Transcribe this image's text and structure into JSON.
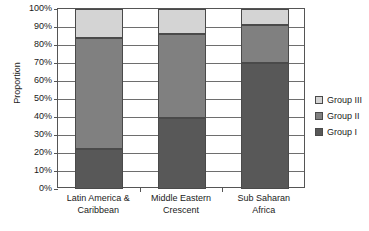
{
  "chart_data": {
    "type": "bar",
    "stacked": true,
    "stack_mode": "percent",
    "title": "",
    "xlabel": "",
    "ylabel": "Proportion",
    "ylim": [
      0,
      100
    ],
    "y_tick_labels": [
      "100%",
      "90%",
      "80%",
      "70%",
      "60%",
      "50%",
      "40%",
      "30%",
      "20%",
      "10%",
      "0%"
    ],
    "y_ticks": [
      100,
      90,
      80,
      70,
      60,
      50,
      40,
      30,
      20,
      10,
      0
    ],
    "grid": true,
    "legend_position": "right",
    "categories": [
      "Latin America & Caribbean",
      "Middle Eastern Crescent",
      "Sub Saharan Africa"
    ],
    "category_lines": [
      [
        "Latin America &",
        "Caribbean"
      ],
      [
        "Middle Eastern",
        "Crescent"
      ],
      [
        "Sub Saharan",
        "Africa"
      ]
    ],
    "series": [
      {
        "name": "Group I",
        "color": "#585858",
        "values": [
          22,
          39.5,
          70
        ]
      },
      {
        "name": "Group II",
        "color": "#808080",
        "values": [
          62,
          46.5,
          21
        ]
      },
      {
        "name": "Group III",
        "color": "#d4d4d4",
        "values": [
          16,
          14,
          9
        ]
      }
    ],
    "legend_order": [
      "Group III",
      "Group II",
      "Group I"
    ],
    "cumulative_tops": [
      {
        "category": "Latin America & Caribbean",
        "group_i_top": 22,
        "group_ii_top": 84,
        "group_iii_top": 100
      },
      {
        "category": "Middle Eastern Crescent",
        "group_i_top": 39.5,
        "group_ii_top": 86,
        "group_iii_top": 100
      },
      {
        "category": "Sub Saharan Africa",
        "group_i_top": 70,
        "group_ii_top": 91,
        "group_iii_top": 100
      }
    ]
  },
  "legend": {
    "items": [
      {
        "label": "Group III",
        "color": "#d4d4d4"
      },
      {
        "label": "Group II",
        "color": "#808080"
      },
      {
        "label": "Group I",
        "color": "#585858"
      }
    ]
  },
  "axes": {
    "y_title": "Proportion"
  }
}
